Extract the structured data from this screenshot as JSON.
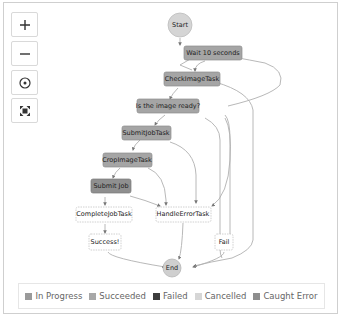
{
  "controls": {
    "zoom_in": "+",
    "zoom_out": "−",
    "center": "center",
    "fit": "fit"
  },
  "graph": {
    "nodes": {
      "start": "Start",
      "wait": "Wait 10 seconds",
      "check": "CheckImageTask",
      "ready": "Is the image ready?",
      "submit_task": "SubmitJobTask",
      "crop": "CropImageTask",
      "submit_job": "Submit Job",
      "complete": "CompleteJobTask",
      "handle_error": "HandleErrorTask",
      "success": "Success!",
      "fail": "Fail",
      "end": "End"
    }
  },
  "legend": {
    "items": [
      {
        "label": "In Progress",
        "color": "#9a9a9a"
      },
      {
        "label": "Succeeded",
        "color": "#a8a8a8"
      },
      {
        "label": "Failed",
        "color": "#3d3d3d"
      },
      {
        "label": "Cancelled",
        "color": "#d6d6d6"
      },
      {
        "label": "Caught Error",
        "color": "#8e8e8e"
      }
    ]
  },
  "colors": {
    "task_fill": "#a3a3a3",
    "task_border": "#8c8c8c",
    "circle_fill": "#d2d2d2",
    "edge": "#b0b0b0"
  }
}
